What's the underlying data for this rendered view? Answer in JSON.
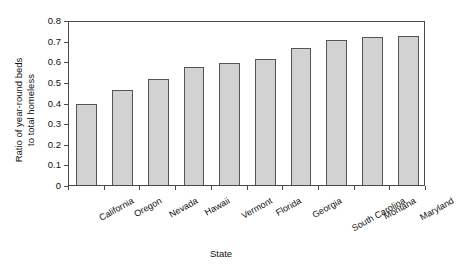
{
  "chart_data": {
    "type": "bar",
    "title": "",
    "xlabel": "State",
    "ylabel": "Ratio of year-round beds to total homeless",
    "ylabel_line1": "Ratio of year-round beds",
    "ylabel_line2": "to total homeless",
    "categories": [
      "California",
      "Oregon",
      "Nevada",
      "Hawaii",
      "Vermont",
      "Florida",
      "Georgia",
      "South Carolina",
      "Montana",
      "Maryland"
    ],
    "values": [
      0.395,
      0.462,
      0.512,
      0.573,
      0.593,
      0.612,
      0.665,
      0.703,
      0.717,
      0.722
    ],
    "ylim": [
      0,
      0.8
    ],
    "yticks": [
      0,
      0.1,
      0.2,
      0.3,
      0.4,
      0.5,
      0.6,
      0.7,
      0.8
    ],
    "ytick_labels": [
      "0",
      "0.1",
      "0.2",
      "0.3",
      "0.4",
      "0.5",
      "0.6",
      "0.7",
      "0.8"
    ],
    "grid": false,
    "legend": false,
    "bar_fill_color": "#d2d2d2",
    "bar_edge_color": "#555555",
    "axis_color": "#4a4a4a",
    "background_color": "#ffffff"
  }
}
